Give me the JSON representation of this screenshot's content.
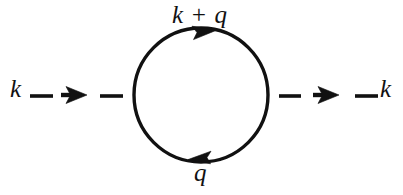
{
  "diagram": {
    "name": "one-loop self-energy Feynman diagram",
    "type": "feynman-diagram",
    "background_color": "#ffffff",
    "stroke_color": "#111111",
    "labels": {
      "incoming_momentum": "k",
      "outgoing_momentum": "k",
      "upper_loop_momentum": "k + q",
      "lower_loop_momentum": "q"
    },
    "loop": {
      "center_x": 201,
      "center_y": 95,
      "radius": 67,
      "stroke_width": 3.4,
      "upper_arrow_direction": "right",
      "lower_arrow_direction": "left"
    },
    "external_lines": {
      "left": {
        "dashes": 2,
        "arrow_direction": "right",
        "y": 95
      },
      "right": {
        "dashes": 2,
        "arrow_direction": "right",
        "y": 95
      }
    }
  }
}
